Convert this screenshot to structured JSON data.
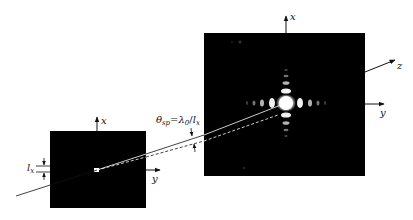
{
  "diagram": {
    "type": "single-slit / aperture Fraunhofer diffraction schematic",
    "colors": {
      "background": "#ffffff",
      "screen": "#000000",
      "line": "#111111",
      "beam": "#ffffff",
      "spot": "#ffffff"
    },
    "source_plane": {
      "axes": {
        "x_label": "x",
        "y_label": "y"
      },
      "aperture_size_label_main": "l",
      "aperture_size_label_sub": "x"
    },
    "far_field_plane": {
      "axes": {
        "x_label": "x",
        "y_label": "y",
        "z_label": "z"
      }
    },
    "angle_label": {
      "theta": "θ",
      "theta_sub": "sp",
      "equals": "=",
      "lambda": "λ",
      "lambda_sub": "0",
      "slash": "/",
      "l": "l",
      "l_sub": "x"
    }
  }
}
